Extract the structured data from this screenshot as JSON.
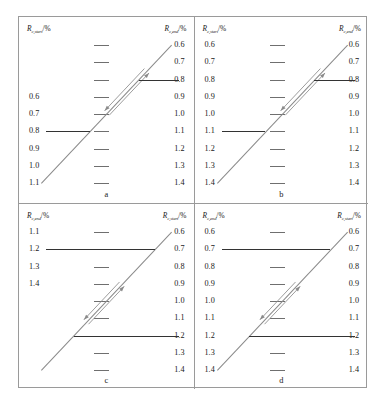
{
  "figure": {
    "axis_caption": {
      "symbol": "R",
      "percent": "/%",
      "sub_start": "c,start",
      "sub_end": "c,end"
    },
    "panels": [
      {
        "id": "a",
        "letter": "a",
        "left_caption_sub": "c,start",
        "right_caption_sub": "c,end",
        "left_labels": [
          "",
          "",
          "",
          "0.6",
          "0.7",
          "0.8",
          "0.9",
          "1.0",
          "1.1"
        ],
        "right_labels": [
          "0.6",
          "0.7",
          "0.8",
          "0.9",
          "1.0",
          "1.1",
          "1.2",
          "1.3",
          "1.4"
        ],
        "ticks": 9,
        "bold_lines": [
          {
            "side": "left",
            "row": 5,
            "label": "0.8"
          },
          {
            "side": "right",
            "row": 2,
            "label": "0.8"
          }
        ],
        "diagonal": {
          "x1": 22,
          "y1": 166,
          "x2": 152,
          "y2": 28
        }
      },
      {
        "id": "b",
        "letter": "b",
        "left_caption_sub": "c,start",
        "right_caption_sub": "c,end",
        "left_labels": [
          "0.6",
          "0.7",
          "0.8",
          "0.9",
          "1.0",
          "1.1",
          "1.2",
          "1.3",
          "1.4"
        ],
        "right_labels": [
          "0.6",
          "0.7",
          "0.8",
          "0.9",
          "1.0",
          "1.1",
          "1.2",
          "1.3",
          "1.4"
        ],
        "ticks": 9,
        "bold_lines": [
          {
            "side": "left",
            "row": 5,
            "label": "1.1"
          },
          {
            "side": "right",
            "row": 2,
            "label": "0.8"
          }
        ],
        "diagonal": {
          "x1": 22,
          "y1": 166,
          "x2": 152,
          "y2": 28
        }
      },
      {
        "id": "c",
        "letter": "c",
        "left_caption_sub": "c,end",
        "right_caption_sub": "c,start",
        "left_labels": [
          "1.1",
          "1.2",
          "1.3",
          "1.4",
          "",
          "",
          "",
          "",
          ""
        ],
        "right_labels": [
          "0.6",
          "0.7",
          "0.8",
          "0.9",
          "1.0",
          "1.1",
          "1.2",
          "1.3",
          "1.4"
        ],
        "ticks": 9,
        "bold_lines": [
          {
            "side": "left",
            "row": 1,
            "label": "1.2"
          },
          {
            "side": "right",
            "row": 6,
            "label": "1.2"
          }
        ],
        "diagonal": {
          "x1": 22,
          "y1": 166,
          "x2": 152,
          "y2": 28
        }
      },
      {
        "id": "d",
        "letter": "d",
        "left_caption_sub": "c,end",
        "right_caption_sub": "c,start",
        "left_labels": [
          "0.6",
          "0.7",
          "0.8",
          "0.9",
          "1.0",
          "1.1",
          "1.2",
          "1.3",
          "1.4"
        ],
        "right_labels": [
          "0.6",
          "0.7",
          "0.8",
          "0.9",
          "1.0",
          "1.1",
          "1.2",
          "1.3",
          "1.4"
        ],
        "ticks": 9,
        "bold_lines": [
          {
            "side": "left",
            "row": 1,
            "label": "0.7"
          },
          {
            "side": "right",
            "row": 6,
            "label": "1.2"
          }
        ],
        "diagonal": {
          "x1": 22,
          "y1": 166,
          "x2": 152,
          "y2": 28
        }
      }
    ]
  },
  "chart_data": {
    "type": "line",
    "title": "",
    "xlabel": "",
    "ylabel": "",
    "scale_values": [
      0.6,
      0.7,
      0.8,
      0.9,
      1.0,
      1.1,
      1.2,
      1.3,
      1.4
    ],
    "series": [
      {
        "name": "a",
        "left_axis": "R_c,start/%",
        "right_axis": "R_c,end/%",
        "left_visible_values": [
          0.6,
          0.7,
          0.8,
          0.9,
          1.0,
          1.1
        ],
        "right_visible_values": [
          0.6,
          0.7,
          0.8,
          0.9,
          1.0,
          1.1,
          1.2,
          1.3,
          1.4
        ],
        "reading": {
          "left_value": 0.8,
          "right_value": 0.8
        }
      },
      {
        "name": "b",
        "left_axis": "R_c,start/%",
        "right_axis": "R_c,end/%",
        "left_visible_values": [
          0.6,
          0.7,
          0.8,
          0.9,
          1.0,
          1.1,
          1.2,
          1.3,
          1.4
        ],
        "right_visible_values": [
          0.6,
          0.7,
          0.8,
          0.9,
          1.0,
          1.1,
          1.2,
          1.3,
          1.4
        ],
        "reading": {
          "left_value": 1.1,
          "right_value": 0.8
        }
      },
      {
        "name": "c",
        "left_axis": "R_c,end/%",
        "right_axis": "R_c,start/%",
        "left_visible_values": [
          1.1,
          1.2,
          1.3,
          1.4
        ],
        "right_visible_values": [
          0.6,
          0.7,
          0.8,
          0.9,
          1.0,
          1.1,
          1.2,
          1.3,
          1.4
        ],
        "reading": {
          "left_value": 1.2,
          "right_value": 1.2
        }
      },
      {
        "name": "d",
        "left_axis": "R_c,end/%",
        "right_axis": "R_c,start/%",
        "left_visible_values": [
          0.6,
          0.7,
          0.8,
          0.9,
          1.0,
          1.1,
          1.2,
          1.3,
          1.4
        ],
        "right_visible_values": [
          0.6,
          0.7,
          0.8,
          0.9,
          1.0,
          1.1,
          1.2,
          1.3,
          1.4
        ],
        "reading": {
          "left_value": 0.7,
          "right_value": 1.2
        }
      }
    ],
    "legend": [],
    "grid": false
  }
}
